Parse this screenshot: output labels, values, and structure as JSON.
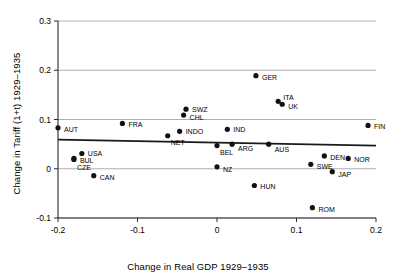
{
  "chart_data": {
    "type": "scatter",
    "title": "",
    "xlabel": "Change in Real GDP 1929–1935",
    "ylabel": "Change in Tariff (1+t) 1929–1935",
    "xlim": [
      -0.2,
      0.2
    ],
    "ylim": [
      -0.1,
      0.3
    ],
    "xticks": [
      "-0.2",
      "-0.1",
      "0",
      "0.1",
      "0.2"
    ],
    "xtick_values": [
      -0.2,
      -0.1,
      0,
      0.1,
      0.2
    ],
    "yticks": [
      "-0.1",
      "0",
      "0.1",
      "0.2",
      "0.3"
    ],
    "ytick_values": [
      -0.1,
      0,
      0.1,
      0.2,
      0.3
    ],
    "grid": true,
    "grid_axis": "y",
    "legend": false,
    "marker_color": "#111111",
    "fitline_color": "#1a1a1a",
    "points": [
      {
        "label": "AUT",
        "x": -0.2,
        "y": 0.083,
        "lx": 6,
        "ly": 4
      },
      {
        "label": "FRA",
        "x": -0.119,
        "y": 0.092,
        "lx": 6,
        "ly": 4
      },
      {
        "label": "USA",
        "x": -0.17,
        "y": 0.031,
        "lx": 6,
        "ly": 3
      },
      {
        "label": "BUL",
        "x": -0.18,
        "y": 0.021,
        "lx": 6,
        "ly": 5
      },
      {
        "label": "CZE",
        "x": -0.18,
        "y": 0.019,
        "lx": 3,
        "ly": 11
      },
      {
        "label": "CAN",
        "x": -0.155,
        "y": -0.014,
        "lx": 6,
        "ly": 4
      },
      {
        "label": "NET",
        "x": -0.062,
        "y": 0.067,
        "lx": 3,
        "ly": 9
      },
      {
        "label": "INDO",
        "x": -0.047,
        "y": 0.076,
        "lx": 6,
        "ly": 3
      },
      {
        "label": "SWZ",
        "x": -0.039,
        "y": 0.121,
        "lx": 6,
        "ly": 3
      },
      {
        "label": "CHL",
        "x": -0.042,
        "y": 0.109,
        "lx": 6,
        "ly": 5
      },
      {
        "label": "IND",
        "x": 0.013,
        "y": 0.08,
        "lx": 6,
        "ly": 3
      },
      {
        "label": "BEL",
        "x": 0.0,
        "y": 0.047,
        "lx": 3,
        "ly": 9
      },
      {
        "label": "ARG",
        "x": 0.019,
        "y": 0.05,
        "lx": 6,
        "ly": 7
      },
      {
        "label": "AUS",
        "x": 0.065,
        "y": 0.05,
        "lx": 6,
        "ly": 8
      },
      {
        "label": "NZ",
        "x": 0.0,
        "y": 0.004,
        "lx": 6,
        "ly": 5
      },
      {
        "label": "GER",
        "x": 0.049,
        "y": 0.189,
        "lx": 6,
        "ly": 4
      },
      {
        "label": "ITA",
        "x": 0.077,
        "y": 0.137,
        "lx": 5,
        "ly": -1
      },
      {
        "label": "UK",
        "x": 0.082,
        "y": 0.131,
        "lx": 6,
        "ly": 5
      },
      {
        "label": "FIN",
        "x": 0.19,
        "y": 0.088,
        "lx": 6,
        "ly": 4
      },
      {
        "label": "DEN",
        "x": 0.135,
        "y": 0.026,
        "lx": 6,
        "ly": 4
      },
      {
        "label": "NOR",
        "x": 0.165,
        "y": 0.021,
        "lx": 6,
        "ly": 4
      },
      {
        "label": "SWE",
        "x": 0.118,
        "y": 0.009,
        "lx": 6,
        "ly": 5
      },
      {
        "label": "JAP",
        "x": 0.145,
        "y": -0.006,
        "lx": 6,
        "ly": 5
      },
      {
        "label": "HUN",
        "x": 0.047,
        "y": -0.034,
        "lx": 6,
        "ly": 4
      },
      {
        "label": "ROM",
        "x": 0.12,
        "y": -0.079,
        "lx": 6,
        "ly": 4
      }
    ],
    "fitline": {
      "x0": -0.2,
      "y0": 0.059,
      "x1": 0.2,
      "y1": 0.047
    }
  }
}
